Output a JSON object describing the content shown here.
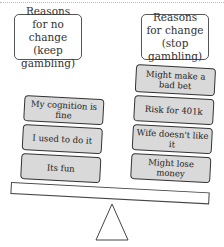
{
  "diagram": {
    "type": "balance-scale / decisional balance",
    "left_header": "Reasons for no change (keep gambling)",
    "right_header": "Reasons for change (stop gambling)",
    "left_items": [
      "My cognition is fine",
      "I used to do it",
      "Its fun"
    ],
    "right_items": [
      "Might make a bad bet",
      "Risk for 401k",
      "Wife doesn't like it",
      "Might lose money"
    ],
    "tilt": "right side heavier (scale tilts down to the right)",
    "colors": {
      "card_fill": "#d9d9d9",
      "card_border": "#333333",
      "header_border": "#555555"
    }
  }
}
